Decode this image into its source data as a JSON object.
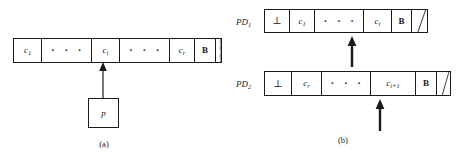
{
  "figure": {
    "width": 463,
    "height": 158,
    "ink_color": "#1a1a1a",
    "background": "#ffffff"
  },
  "panel_a": {
    "caption": "(a)",
    "tape": {
      "name": "input-tape",
      "cells": [
        {
          "text": "c",
          "sub": "1",
          "kind": "symbol"
        },
        {
          "text": "· · ·",
          "sub": "",
          "kind": "ellipsis"
        },
        {
          "text": "c",
          "sub": "i",
          "kind": "symbol"
        },
        {
          "text": "· · ·",
          "sub": "",
          "kind": "ellipsis"
        },
        {
          "text": "c",
          "sub": "r",
          "kind": "symbol"
        },
        {
          "text": "B",
          "sub": "",
          "kind": "blank"
        },
        {
          "text": "",
          "sub": "",
          "kind": "torn"
        }
      ]
    },
    "pointer_box": {
      "label": "p"
    },
    "arrow": {
      "name": "pointer-arrow",
      "style": "thin"
    }
  },
  "panel_b": {
    "caption": "(b)",
    "tapes": [
      {
        "name": "pd1-tape",
        "label": "PD",
        "label_sub": "1",
        "cells": [
          {
            "text": "⊥",
            "sub": "",
            "kind": "bottom"
          },
          {
            "text": "c",
            "sub": "1",
            "kind": "symbol"
          },
          {
            "text": "· · ·",
            "sub": "",
            "kind": "ellipsis"
          },
          {
            "text": "c",
            "sub": "i",
            "kind": "symbol"
          },
          {
            "text": "B",
            "sub": "",
            "kind": "blank"
          },
          {
            "text": "",
            "sub": "",
            "kind": "torn"
          }
        ],
        "arrow": {
          "name": "pd1-head-arrow",
          "style": "thick"
        }
      },
      {
        "name": "pd2-tape",
        "label": "PD",
        "label_sub": "2",
        "cells": [
          {
            "text": "⊥",
            "sub": "",
            "kind": "bottom"
          },
          {
            "text": "c",
            "sub": "r",
            "kind": "symbol"
          },
          {
            "text": "· · ·",
            "sub": "",
            "kind": "ellipsis"
          },
          {
            "text": "c",
            "sub": "i+1",
            "kind": "symbol"
          },
          {
            "text": "B",
            "sub": "",
            "kind": "blank"
          },
          {
            "text": "",
            "sub": "",
            "kind": "torn"
          }
        ],
        "arrow": {
          "name": "pd2-head-arrow",
          "style": "thick"
        }
      }
    ]
  }
}
